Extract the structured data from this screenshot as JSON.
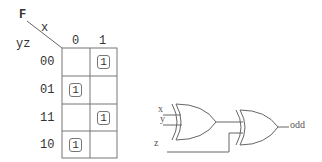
{
  "kmap": {
    "function_label": "F",
    "column_var": "x",
    "row_vars": "yz",
    "column_headers": [
      "0",
      "1"
    ],
    "row_headers": [
      "00",
      "01",
      "11",
      "10"
    ],
    "cells": [
      [
        "",
        "1"
      ],
      [
        "1",
        ""
      ],
      [
        "",
        "1"
      ],
      [
        "1",
        ""
      ]
    ]
  },
  "circuit": {
    "inputs": [
      "x",
      "y",
      "z"
    ],
    "gates": [
      "XOR",
      "XOR"
    ],
    "output_label": "odd"
  }
}
